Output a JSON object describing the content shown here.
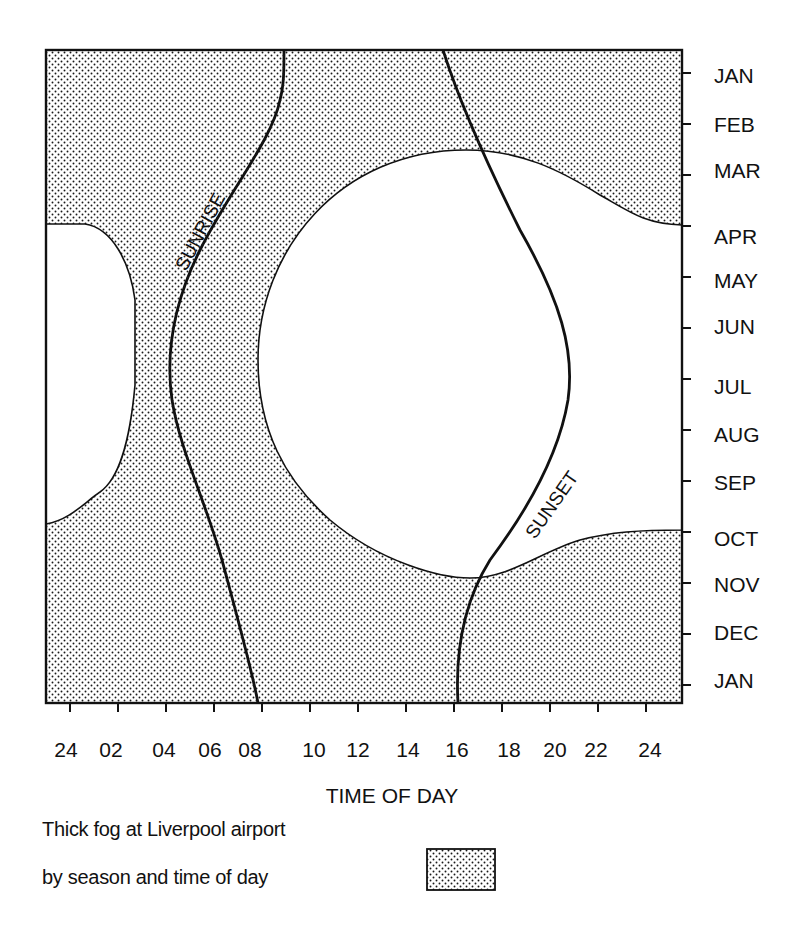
{
  "chart_data": {
    "type": "area",
    "xlabel": "TIME OF DAY",
    "ylabel": "",
    "x_ticks": [
      "24",
      "02",
      "04",
      "06",
      "08",
      "10",
      "12",
      "14",
      "16",
      "18",
      "20",
      "22",
      "24"
    ],
    "y_ticks": [
      "JAN",
      "FEB",
      "MAR",
      "APR",
      "MAY",
      "JUN",
      "JUL",
      "AUG",
      "SEP",
      "OCT",
      "NOV",
      "DEC",
      "JAN"
    ],
    "xlim": [
      23,
      25
    ],
    "ylim_months": [
      "JAN (top)",
      "JAN (bottom)"
    ],
    "grid": false,
    "legend": {
      "position": "bottom",
      "entries": [
        {
          "label": "Thick fog (stippled area)",
          "pattern": "dots"
        }
      ]
    },
    "series": [
      {
        "name": "Fog-free region (daytime, summer)",
        "kind": "clear-region",
        "description": "Large rounded clear (no thick fog) region spanning roughly 09-25h, from mid-March (top at ~MAR) to early November",
        "boundary_points": [
          {
            "month": "MAR",
            "hour": 17
          },
          {
            "month": "APR",
            "hour": 25
          },
          {
            "month": "JUN",
            "hour": 9.5
          },
          {
            "month": "JUL",
            "hour": 9.3
          },
          {
            "month": "OCT",
            "hour": 25
          },
          {
            "month": "NOV",
            "hour": 16
          }
        ]
      },
      {
        "name": "Fog-free region (night, summer)",
        "kind": "clear-region",
        "description": "Clear region at left edge from APR to OCT, bulging to ~03h",
        "boundary_points": [
          {
            "month": "APR",
            "hour": 23
          },
          {
            "month": "JUN",
            "hour": 3.2
          },
          {
            "month": "OCT",
            "hour": 23
          }
        ]
      },
      {
        "name": "SUNRISE",
        "kind": "line",
        "points": [
          {
            "month": "JAN",
            "hour": 8.8
          },
          {
            "month": "MAR",
            "hour": 7.0
          },
          {
            "month": "MAY",
            "hour": 4.8
          },
          {
            "month": "JUL",
            "hour": 4.1
          },
          {
            "month": "SEP",
            "hour": 5.4
          },
          {
            "month": "NOV",
            "hour": 6.8
          },
          {
            "month": "JAN",
            "hour": 7.9
          }
        ]
      },
      {
        "name": "SUNSET",
        "kind": "line",
        "points": [
          {
            "month": "JAN",
            "hour": 16.1
          },
          {
            "month": "MAR",
            "hour": 17.6
          },
          {
            "month": "MAY",
            "hour": 19.4
          },
          {
            "month": "JUL",
            "hour": 20.3
          },
          {
            "month": "SEP",
            "hour": 18.9
          },
          {
            "month": "NOV",
            "hour": 16.9
          },
          {
            "month": "JAN",
            "hour": 16.0
          }
        ]
      }
    ]
  },
  "labels": {
    "sunrise": "SUNRISE",
    "sunset": "SUNSET",
    "x_axis_title": "TIME OF DAY",
    "caption_line1": "Thick fog at Liverpool airport",
    "caption_line2": "by season and time of day"
  },
  "x_ticks": [
    "24",
    "02",
    "04",
    "06",
    "08",
    "10",
    "12",
    "14",
    "16",
    "18",
    "20",
    "22",
    "24"
  ],
  "y_ticks": [
    "JAN",
    "FEB",
    "MAR",
    "APR",
    "MAY",
    "JUN",
    "JUL",
    "AUG",
    "SEP",
    "OCT",
    "NOV",
    "DEC",
    "JAN"
  ]
}
